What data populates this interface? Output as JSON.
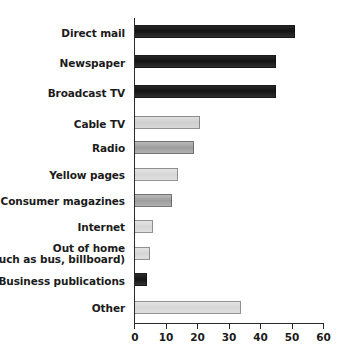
{
  "chart_data": {
    "type": "bar",
    "orientation": "horizontal",
    "title": "",
    "subtitle": "",
    "xlabel": "",
    "ylabel": "",
    "xlim": [
      0,
      60
    ],
    "grid": false,
    "legend": null,
    "xticks": [
      0,
      10,
      20,
      30,
      40,
      50,
      60
    ],
    "xtick_labels": [
      "0",
      "10",
      "20",
      "30",
      "40",
      "50",
      "60"
    ],
    "categories": [
      "Direct mail",
      "Newspaper",
      "Broadcast TV",
      "Cable TV",
      "Radio",
      "Yellow pages",
      "Consumer magazines",
      "Internet",
      "Out of home\n(such as bus, billboard)",
      "Business publications",
      "Other"
    ],
    "values": [
      51,
      45,
      45,
      21,
      19,
      14,
      12,
      6,
      5,
      4,
      34
    ],
    "bar_shades": [
      "#141414",
      "#141414",
      "#141414",
      "#d4d4d4",
      "#a5a5a5",
      "#dadada",
      "#a8a8a8",
      "#dedede",
      "#dedede",
      "#1c1c1c",
      "#dcdcdc"
    ]
  },
  "axis": {
    "tick_labels": [
      "0",
      "10",
      "20",
      "30",
      "40",
      "50",
      "60"
    ]
  },
  "labels": {
    "direct_mail": "Direct mail",
    "newspaper": "Newspaper",
    "broadcast_tv": "Broadcast TV",
    "cable_tv": "Cable TV",
    "radio": "Radio",
    "yellow_pages": "Yellow pages",
    "consumer_magazines": "Consumer magazines",
    "internet": "Internet",
    "out_of_home_line1": "Out of home",
    "out_of_home_line2": "(such as bus, billboard)",
    "business_publications": "Business publications",
    "other": "Other"
  }
}
